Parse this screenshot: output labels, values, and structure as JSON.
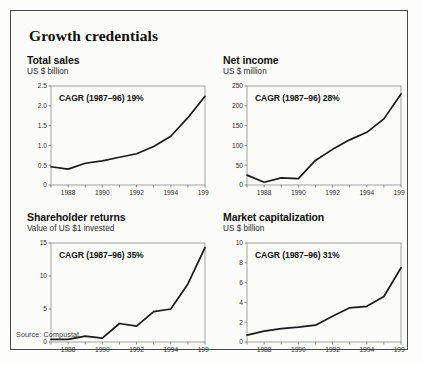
{
  "figure": {
    "title": "Growth credentials",
    "source": "Source: Compustat",
    "frame_color": "#4a4a4a",
    "background": "#fbfbf8",
    "line_color": "#1a1a1a"
  },
  "chart_data": [
    {
      "id": "total-sales",
      "type": "line",
      "title": "Total sales",
      "subtitle": "US $ billion",
      "annotation": "CAGR (1987–96) 19%",
      "xlabel": "",
      "ylabel": "US $ billion",
      "x": [
        1987,
        1988,
        1989,
        1990,
        1991,
        1992,
        1993,
        1994,
        1995,
        1996
      ],
      "values": [
        0.46,
        0.4,
        0.55,
        0.61,
        0.7,
        0.79,
        0.97,
        1.23,
        1.7,
        2.24
      ],
      "xlim": [
        1987,
        1996
      ],
      "ylim": [
        0,
        2.5
      ],
      "yticks": [
        0,
        0.5,
        1.0,
        1.5,
        2.0,
        2.5
      ],
      "ytick_labels": [
        "0",
        "0.5",
        "1.0",
        "1.5",
        "2.0",
        "2.5"
      ],
      "xticks": [
        1987,
        1988,
        1989,
        1990,
        1991,
        1992,
        1993,
        1994,
        1995,
        1996
      ],
      "xtick_labels": [
        "",
        "1988",
        "",
        "1990",
        "",
        "1992",
        "",
        "1994",
        "",
        "1996"
      ],
      "grid": false,
      "legend": "none"
    },
    {
      "id": "net-income",
      "type": "line",
      "title": "Net income",
      "subtitle": "US $ million",
      "annotation": "CAGR (1987–96) 28%",
      "xlabel": "",
      "ylabel": "US $ million",
      "x": [
        1987,
        1988,
        1989,
        1990,
        1991,
        1992,
        1993,
        1994,
        1995,
        1996
      ],
      "values": [
        25,
        7,
        18,
        16,
        62,
        90,
        114,
        133,
        167,
        230
      ],
      "xlim": [
        1987,
        1996
      ],
      "ylim": [
        0,
        250
      ],
      "yticks": [
        0,
        50,
        100,
        150,
        200,
        250
      ],
      "ytick_labels": [
        "0",
        "50",
        "100",
        "150",
        "200",
        "250"
      ],
      "xticks": [
        1987,
        1988,
        1989,
        1990,
        1991,
        1992,
        1993,
        1994,
        1995,
        1996
      ],
      "xtick_labels": [
        "",
        "1988",
        "",
        "1990",
        "",
        "1992",
        "",
        "1994",
        "",
        "1996"
      ],
      "grid": false,
      "legend": "none"
    },
    {
      "id": "shareholder-returns",
      "type": "line",
      "title": "Shareholder returns",
      "subtitle": "Value of US $1 invested",
      "annotation": "CAGR (1987–96) 35%",
      "xlabel": "",
      "ylabel": "Value of US $1 invested",
      "x": [
        1987,
        1988,
        1989,
        1990,
        1991,
        1992,
        1993,
        1994,
        1995,
        1996
      ],
      "values": [
        0.4,
        0.4,
        0.9,
        0.6,
        2.8,
        2.4,
        4.6,
        5.0,
        8.8,
        14.3
      ],
      "xlim": [
        1987,
        1996
      ],
      "ylim": [
        0,
        15
      ],
      "yticks": [
        0,
        5,
        10,
        15
      ],
      "ytick_labels": [
        "0",
        "5",
        "10",
        "15"
      ],
      "xticks": [
        1987,
        1988,
        1989,
        1990,
        1991,
        1992,
        1993,
        1994,
        1995,
        1996
      ],
      "xtick_labels": [
        "",
        "1988",
        "",
        "1990",
        "",
        "1992",
        "",
        "1994",
        "",
        "1996"
      ],
      "grid": false,
      "legend": "none"
    },
    {
      "id": "market-capitalization",
      "type": "line",
      "title": "Market capitalization",
      "subtitle": "US $ billion",
      "annotation": "CAGR (1987–96) 31%",
      "xlabel": "",
      "ylabel": "US $ billion",
      "x": [
        1987,
        1988,
        1989,
        1990,
        1991,
        1992,
        1993,
        1994,
        1995,
        1996
      ],
      "values": [
        0.7,
        1.1,
        1.35,
        1.5,
        1.7,
        2.6,
        3.45,
        3.6,
        4.6,
        7.5
      ],
      "xlim": [
        1987,
        1996
      ],
      "ylim": [
        0,
        10
      ],
      "yticks": [
        0,
        2,
        4,
        6,
        8,
        10
      ],
      "ytick_labels": [
        "0",
        "2",
        "4",
        "6",
        "8",
        "10"
      ],
      "xticks": [
        1987,
        1988,
        1989,
        1990,
        1991,
        1992,
        1993,
        1994,
        1995,
        1996
      ],
      "xtick_labels": [
        "",
        "1988",
        "",
        "1990",
        "",
        "1992",
        "",
        "1994",
        "",
        "1996"
      ],
      "grid": false,
      "legend": "none"
    }
  ]
}
